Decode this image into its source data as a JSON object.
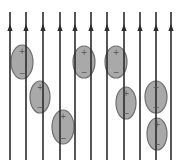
{
  "diagram": {
    "colors": {
      "background": "#ffffff",
      "field_line": "#2b2b2b",
      "molecule_fill": "#a9a9a9",
      "molecule_stroke": "#6e6e6e",
      "sign": "#555555"
    },
    "field_lines": {
      "direction": "up",
      "top_y": 12,
      "bottom_y": 160,
      "arrow_y": 28,
      "x_positions": [
        10,
        26,
        43,
        60,
        75,
        91,
        107,
        124,
        140,
        156,
        171
      ]
    },
    "molecules": [
      {
        "cx": 22,
        "cy": 62,
        "rx": 11,
        "ry": 17,
        "top_sign": "+",
        "bottom_sign": "−"
      },
      {
        "cx": 40,
        "cy": 97,
        "rx": 10,
        "ry": 16,
        "top_sign": "+",
        "bottom_sign": "−"
      },
      {
        "cx": 63,
        "cy": 127,
        "rx": 11,
        "ry": 17,
        "top_sign": "+",
        "bottom_sign": "−"
      },
      {
        "cx": 84,
        "cy": 62,
        "rx": 11,
        "ry": 16,
        "top_sign": "+",
        "bottom_sign": "−"
      },
      {
        "cx": 116,
        "cy": 62,
        "rx": 11,
        "ry": 16,
        "top_sign": "+",
        "bottom_sign": "−"
      },
      {
        "cx": 126,
        "cy": 103,
        "rx": 10,
        "ry": 16,
        "top_sign": "+",
        "bottom_sign": "−"
      },
      {
        "cx": 156,
        "cy": 97,
        "rx": 11,
        "ry": 16,
        "top_sign": "−",
        "bottom_sign": "−"
      },
      {
        "cx": 157,
        "cy": 134,
        "rx": 10,
        "ry": 16,
        "top_sign": "+",
        "bottom_sign": "−"
      }
    ]
  }
}
